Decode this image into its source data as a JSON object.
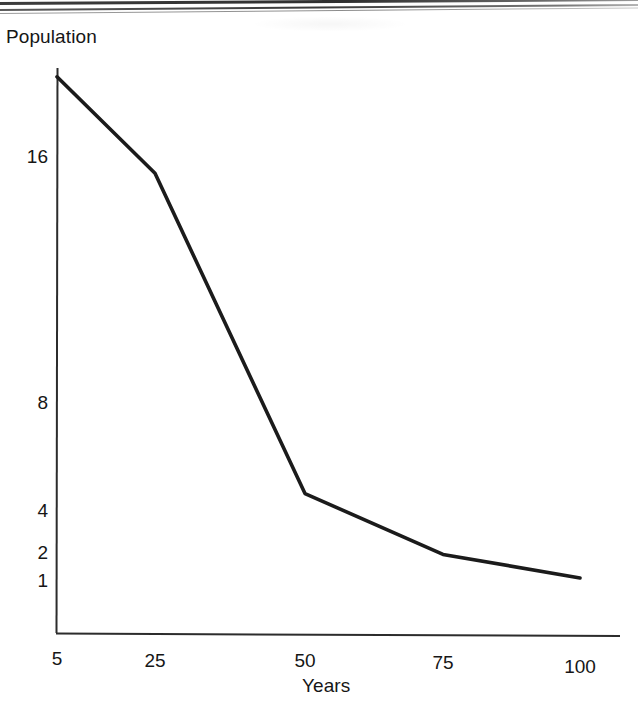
{
  "figure": {
    "background_color": "#ffffff",
    "ink_color": "#161616",
    "line_color": "#1b1b1b"
  },
  "scan_artifacts": {
    "top_edge_lines": 3,
    "description": "dark scanned page edge"
  },
  "chart_data": {
    "type": "line",
    "title": "",
    "xlabel": "Years",
    "ylabel": "Population",
    "yscale": "log2",
    "xscale": "linear",
    "grid": false,
    "legend": null,
    "xlim": [
      5,
      103
    ],
    "ylim": [
      0.78,
      17.5
    ],
    "xticks": [
      5,
      25,
      50,
      75,
      100
    ],
    "xtick_labels": [
      "5",
      "25",
      "50",
      "75",
      "100"
    ],
    "yticks": [
      1,
      2,
      4,
      8,
      16
    ],
    "ytick_labels": [
      "1",
      "2",
      "4",
      "8",
      "16"
    ],
    "series": [
      {
        "name": "Population",
        "x": [
          5,
          25,
          50,
          75,
          100
        ],
        "y": [
          0.8,
          1.05,
          3.6,
          8.5,
          15.2
        ]
      }
    ],
    "annotations": []
  },
  "axes": {
    "y_title": "Population",
    "x_title": "Years",
    "y_labels": [
      {
        "text": "16",
        "value": 16
      },
      {
        "text": "8",
        "value": 8
      },
      {
        "text": "4",
        "value": 4
      },
      {
        "text": "2",
        "value": 2
      },
      {
        "text": "1",
        "value": 1
      }
    ],
    "x_labels": [
      {
        "text": "5",
        "value": 5
      },
      {
        "text": "25",
        "value": 25
      },
      {
        "text": "50",
        "value": 50
      },
      {
        "text": "75",
        "value": 75
      },
      {
        "text": "100",
        "value": 100
      }
    ]
  },
  "geometry": {
    "y_label_y_px": [
      156,
      402,
      510,
      552,
      580
    ],
    "x_label_x_px": [
      57,
      155,
      305,
      443,
      580
    ],
    "vertices_px": [
      [
        70,
        603
      ],
      [
        155,
        580
      ],
      [
        305,
        520
      ],
      [
        443,
        388
      ],
      [
        593,
        181
      ]
    ]
  }
}
